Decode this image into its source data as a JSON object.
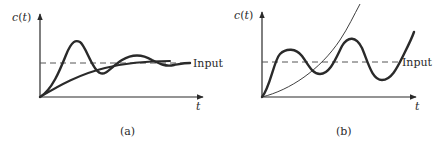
{
  "figure": {
    "panels": [
      {
        "id": "a",
        "caption": "(a)",
        "y_axis_label": "c(t)",
        "x_axis_label": "t",
        "reference_label": "Input",
        "curves": [
          {
            "name": "underdamped-oscillating-response",
            "style": "thick",
            "behavior": "overshoots then decaying oscillation settling to input"
          },
          {
            "name": "overdamped-response",
            "style": "thick",
            "behavior": "monotonic rise approaching input"
          }
        ]
      },
      {
        "id": "b",
        "caption": "(b)",
        "y_axis_label": "c(t)",
        "x_axis_label": "t",
        "reference_label": "Input",
        "curves": [
          {
            "name": "growing-oscillation-response",
            "style": "thick",
            "behavior": "oscillation with growing amplitude (unstable)"
          },
          {
            "name": "exponential-growth-response",
            "style": "thin",
            "behavior": "monotonic unbounded growth (unstable)"
          }
        ]
      }
    ],
    "colors": {
      "ink": "#2a2a2a",
      "dashed": "#555555",
      "background": "#ffffff"
    }
  }
}
